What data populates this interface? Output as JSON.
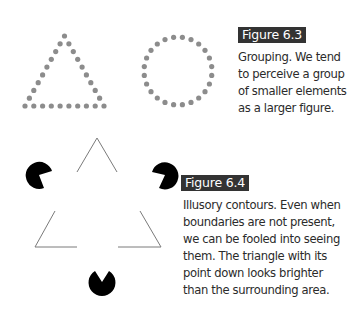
{
  "figure_6_3": {
    "label": "Figure 6.3",
    "caption_lines": [
      "Grouping. We tend",
      "to perceive a group",
      "of smaller elements",
      "as a larger figure."
    ],
    "shapes": [
      "dotted-triangle",
      "dotted-circle"
    ],
    "dot_color": "#8c8c8c"
  },
  "figure_6_4": {
    "label": "Figure 6.4",
    "caption_lines": [
      "Illusory contours. Even when",
      "boundaries are not present,",
      "we can be fooled into seeing",
      "them. The triangle with its",
      "point down looks brighter",
      "than the surrounding area."
    ],
    "shapes": [
      "pacman-top-left",
      "pacman-top-right",
      "pacman-bottom",
      "outline-triangle-corners"
    ],
    "pacman_color": "#000000",
    "line_color": "#7a7a7a"
  },
  "colors": {
    "label_bg": "#333333",
    "label_text": "#ffffff",
    "body_text": "#2b2b2b"
  }
}
